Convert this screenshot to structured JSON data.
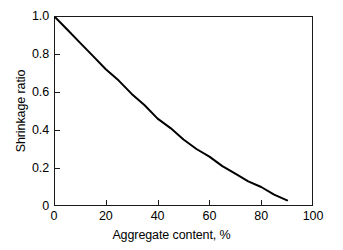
{
  "chart_data": {
    "type": "line",
    "title": "",
    "subtitle": "",
    "xlabel": "Aggregate content, %",
    "ylabel": "Shrinkage ratio",
    "xlim": [
      0,
      100
    ],
    "ylim": [
      0,
      1.0
    ],
    "xticks": [
      0,
      20,
      40,
      60,
      80,
      100
    ],
    "xticklabels": [
      "0",
      "20",
      "40",
      "60",
      "80",
      "100"
    ],
    "yticks": [
      0,
      0.2,
      0.4,
      0.6,
      0.8,
      1.0
    ],
    "yticklabels": [
      "0",
      "0.2",
      "0.4",
      "0.6",
      "0.8",
      "1.0"
    ],
    "grid": false,
    "legend": null,
    "annotations": [],
    "line_color": "#000000",
    "line_width": 2.0,
    "frame_color": "#1a1a1a",
    "background": "#ffffff",
    "series": [
      {
        "name": "Shrinkage ratio vs aggregate content",
        "x": [
          0,
          5,
          10,
          15,
          20,
          25,
          30,
          35,
          40,
          45,
          50,
          55,
          60,
          65,
          70,
          75,
          80,
          85,
          90
        ],
        "values": [
          1.0,
          0.93,
          0.86,
          0.79,
          0.72,
          0.66,
          0.59,
          0.53,
          0.46,
          0.41,
          0.35,
          0.3,
          0.26,
          0.21,
          0.17,
          0.13,
          0.1,
          0.06,
          0.03
        ]
      }
    ]
  },
  "axes": {
    "y": {
      "title": "Shrinkage ratio",
      "ticks": [
        {
          "label": "1.0",
          "value": 1.0
        },
        {
          "label": "0.8",
          "value": 0.8
        },
        {
          "label": "0.6",
          "value": 0.6
        },
        {
          "label": "0.4",
          "value": 0.4
        },
        {
          "label": "0.2",
          "value": 0.2
        },
        {
          "label": "0",
          "value": 0
        }
      ]
    },
    "x": {
      "title": "Aggregate content, %",
      "ticks": [
        {
          "label": "0",
          "value": 0
        },
        {
          "label": "20",
          "value": 20
        },
        {
          "label": "40",
          "value": 40
        },
        {
          "label": "60",
          "value": 60
        },
        {
          "label": "80",
          "value": 80
        },
        {
          "label": "100",
          "value": 100
        }
      ]
    }
  }
}
